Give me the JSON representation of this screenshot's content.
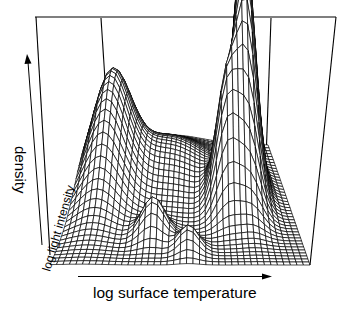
{
  "chart_data": {
    "type": "surface",
    "title": "",
    "xlabel": "log surface temperature",
    "ylabel": "log light intensity",
    "zlabel": "density",
    "axes_style": "arrows (no ticks)",
    "grid": false,
    "legend": null,
    "view": "perspective, looking from front-left, elevation ~30°",
    "peaks": [
      {
        "name": "main peak",
        "x": 0.8,
        "y": 0.62,
        "height": 1.0,
        "sx": 0.05,
        "sy": 0.16
      },
      {
        "name": "shoulder peak",
        "x": 0.7,
        "y": 0.45,
        "height": 0.48,
        "sx": 0.05,
        "sy": 0.1
      },
      {
        "name": "low-temperature peak",
        "x": 0.12,
        "y": 0.62,
        "height": 0.42,
        "sx": 0.09,
        "sy": 0.2
      },
      {
        "name": "front bump 1",
        "x": 0.38,
        "y": 0.22,
        "height": 0.16,
        "sx": 0.05,
        "sy": 0.06
      },
      {
        "name": "front bump 2",
        "x": 0.53,
        "y": 0.12,
        "height": 0.1,
        "sx": 0.04,
        "sy": 0.05
      },
      {
        "name": "plateau",
        "x": 0.4,
        "y": 0.7,
        "height": 0.16,
        "sx": 0.2,
        "sy": 0.18
      }
    ],
    "grid_resolution": 40
  },
  "labels": {
    "x_axis": "log surface temperature",
    "y_axis": "log light intensity",
    "z_axis": "density"
  },
  "colors": {
    "line": "#000000",
    "background": "#ffffff",
    "surface_fill": "#ffffff"
  }
}
